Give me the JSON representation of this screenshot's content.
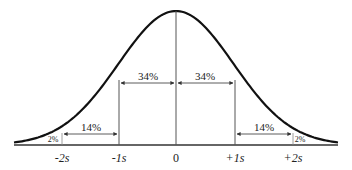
{
  "diagram": {
    "curve_color": "#111111",
    "line_color": "#333333",
    "x_labels": [
      "-2s",
      "-1s",
      "0",
      "+1s",
      "+2s"
    ],
    "regions": [
      {
        "label": "2%",
        "from": "-3s",
        "to": "-2s"
      },
      {
        "label": "14%",
        "from": "-2s",
        "to": "-1s"
      },
      {
        "label": "34%",
        "from": "-1s",
        "to": "0"
      },
      {
        "label": "34%",
        "from": "0",
        "to": "+1s"
      },
      {
        "label": "14%",
        "from": "+1s",
        "to": "+2s"
      },
      {
        "label": "2%",
        "from": "+2s",
        "to": "+3s"
      }
    ]
  }
}
